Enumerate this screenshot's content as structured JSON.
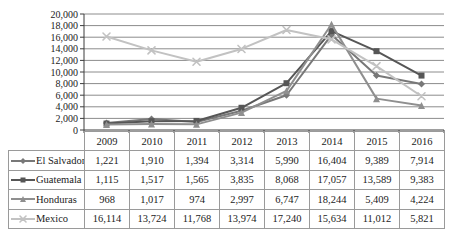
{
  "chart_data": {
    "type": "line",
    "title": "",
    "xlabel": "",
    "ylabel": "",
    "categories": [
      "2009",
      "2010",
      "2011",
      "2012",
      "2013",
      "2014",
      "2015",
      "2016"
    ],
    "series": [
      {
        "name": "El Salvador",
        "marker": "diamond",
        "color": "#787878",
        "values": [
          1221,
          1910,
          1394,
          3314,
          5990,
          16404,
          9389,
          7914
        ]
      },
      {
        "name": "Guatemala",
        "marker": "square",
        "color": "#565656",
        "values": [
          1115,
          1517,
          1565,
          3835,
          8068,
          17057,
          13589,
          9383
        ]
      },
      {
        "name": "Honduras",
        "marker": "triangle",
        "color": "#8f8f8f",
        "values": [
          968,
          1017,
          974,
          2997,
          6747,
          18244,
          5409,
          4224
        ]
      },
      {
        "name": "Mexico",
        "marker": "x",
        "color": "#c2c2c2",
        "values": [
          16114,
          13724,
          11768,
          13974,
          17240,
          15634,
          11012,
          5821
        ]
      }
    ],
    "y_axis": {
      "min": 0,
      "max": 20000,
      "step": 2000
    },
    "grid": true,
    "legend_position": "data-table-left-column",
    "data_table_shown": true
  },
  "colors": {
    "background": "#ffffff",
    "gridline": "#8c8c8c",
    "axis": "#3c3c3c",
    "table_border": "#9a9a9a",
    "text": "#1b1b1b"
  }
}
